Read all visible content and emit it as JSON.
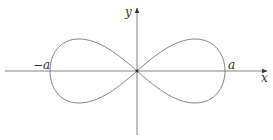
{
  "figure": {
    "title": "",
    "curve": "lemniscate of Bernoulli",
    "labels": {
      "y_axis": "y",
      "x_axis": "x",
      "neg_a": "−a",
      "pos_a": "a"
    },
    "colors": {
      "axis": "#555555",
      "curve": "#777777",
      "text": "#333333"
    }
  }
}
